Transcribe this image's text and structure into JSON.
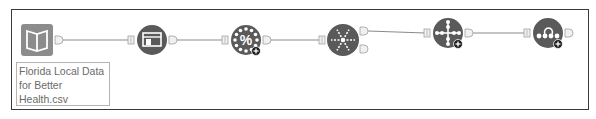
{
  "canvas": {
    "background": "#ffffff",
    "border_color": "#3a3a3a"
  },
  "colors": {
    "tool_fill": "#5a5a5a",
    "input_tool_fill": "#8c8c8c",
    "glyph": "#ffffff",
    "connector": "#8a8a8a",
    "anchor_fill": "#f0f0f0",
    "anchor_stroke": "#a0a0a0",
    "badge_fill": "#1e1e1e"
  },
  "nodes": [
    {
      "id": "input",
      "icon": "book-icon",
      "kind": "input-data",
      "badge": false,
      "inputs": 0,
      "outputs": 1
    },
    {
      "id": "browse",
      "icon": "browse-icon",
      "kind": "tool",
      "badge": false,
      "inputs": 1,
      "outputs": 1
    },
    {
      "id": "formula",
      "icon": "percent-icon",
      "kind": "tool",
      "badge": true,
      "inputs": 1,
      "outputs": 1
    },
    {
      "id": "multirow",
      "icon": "snowflake-icon",
      "kind": "tool",
      "badge": false,
      "inputs": 1,
      "outputs": 2
    },
    {
      "id": "arrange",
      "icon": "crosshair-icon",
      "kind": "tool",
      "badge": true,
      "inputs": 1,
      "outputs": 1
    },
    {
      "id": "join",
      "icon": "loop-dots-icon",
      "kind": "tool",
      "badge": true,
      "inputs": 1,
      "outputs": 1
    }
  ],
  "connections": [
    {
      "from": "input",
      "to": "browse"
    },
    {
      "from": "browse",
      "to": "formula"
    },
    {
      "from": "formula",
      "to": "multirow"
    },
    {
      "from": "multirow",
      "to": "arrange"
    },
    {
      "from": "arrange",
      "to": "join"
    }
  ],
  "annotation": {
    "lines": [
      "Florida Local Data",
      "for Better",
      "Health.csv"
    ]
  }
}
